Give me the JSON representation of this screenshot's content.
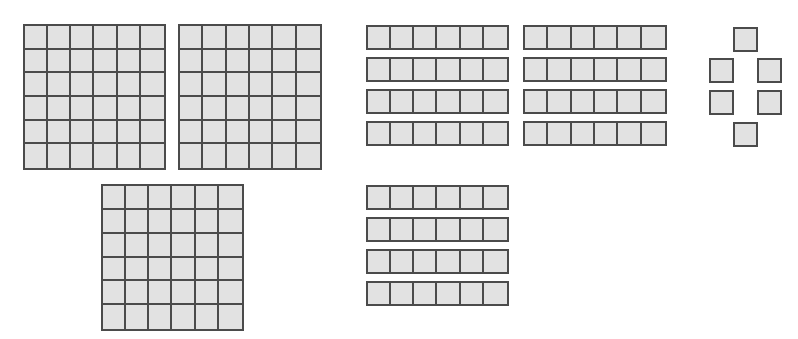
{
  "diagram": {
    "description": "Base-ten style blocks: three 6x6 flats, twelve rods of 6 units, and six single units",
    "colors": {
      "fill": "#e2e2e2",
      "border": "#4b4b4b",
      "background": "#ffffff"
    },
    "flats": {
      "label": "6x6 flats",
      "count": 3,
      "rows": 6,
      "cols": 6,
      "items": [
        {
          "x": 23,
          "y": 24,
          "w": 143,
          "h": 146
        },
        {
          "x": 178,
          "y": 24,
          "w": 144,
          "h": 146
        },
        {
          "x": 101,
          "y": 184,
          "w": 143,
          "h": 147
        }
      ]
    },
    "rods": {
      "label": "rods of 6",
      "count": 12,
      "cells": 6,
      "items": [
        {
          "x": 366,
          "y": 25,
          "w": 143,
          "h": 25
        },
        {
          "x": 366,
          "y": 57,
          "w": 143,
          "h": 25
        },
        {
          "x": 366,
          "y": 89,
          "w": 143,
          "h": 25
        },
        {
          "x": 366,
          "y": 121,
          "w": 143,
          "h": 25
        },
        {
          "x": 523,
          "y": 25,
          "w": 144,
          "h": 25
        },
        {
          "x": 523,
          "y": 57,
          "w": 144,
          "h": 25
        },
        {
          "x": 523,
          "y": 89,
          "w": 144,
          "h": 25
        },
        {
          "x": 523,
          "y": 121,
          "w": 144,
          "h": 25
        },
        {
          "x": 366,
          "y": 185,
          "w": 143,
          "h": 25
        },
        {
          "x": 366,
          "y": 217,
          "w": 143,
          "h": 25
        },
        {
          "x": 366,
          "y": 249,
          "w": 143,
          "h": 25
        },
        {
          "x": 366,
          "y": 281,
          "w": 143,
          "h": 25
        }
      ]
    },
    "units": {
      "label": "single units",
      "count": 6,
      "items": [
        {
          "x": 733,
          "y": 27,
          "w": 25,
          "h": 25
        },
        {
          "x": 709,
          "y": 58,
          "w": 25,
          "h": 25
        },
        {
          "x": 757,
          "y": 58,
          "w": 25,
          "h": 25
        },
        {
          "x": 709,
          "y": 90,
          "w": 25,
          "h": 25
        },
        {
          "x": 757,
          "y": 90,
          "w": 25,
          "h": 25
        },
        {
          "x": 733,
          "y": 122,
          "w": 25,
          "h": 25
        }
      ]
    }
  }
}
